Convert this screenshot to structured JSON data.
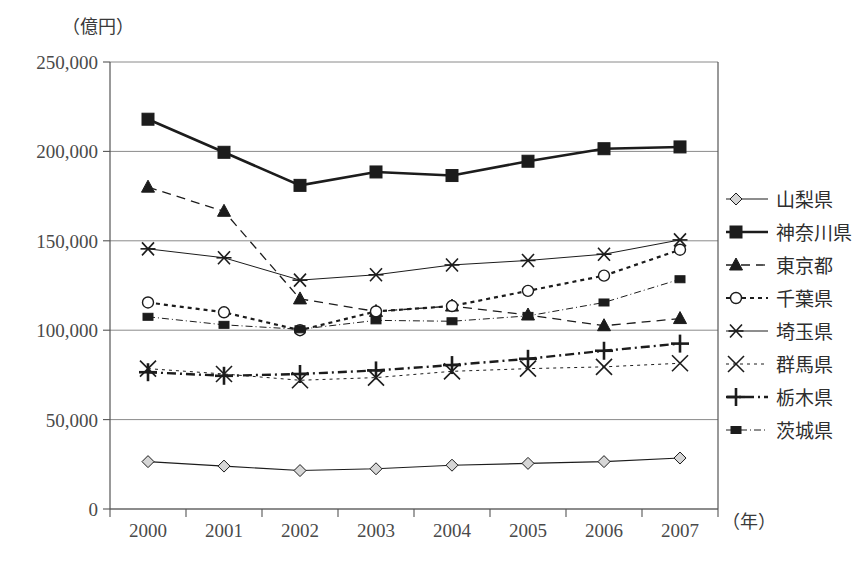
{
  "chart_data": {
    "type": "line",
    "title": "",
    "unit_label": "（億円）",
    "xlabel": "（年）",
    "ylabel": "",
    "categories": [
      "2000",
      "2001",
      "2002",
      "2003",
      "2004",
      "2005",
      "2006",
      "2007"
    ],
    "x": [
      2000,
      2001,
      2002,
      2003,
      2004,
      2005,
      2006,
      2007
    ],
    "ylim": [
      0,
      250000
    ],
    "yticks": [
      0,
      50000,
      100000,
      150000,
      200000,
      250000
    ],
    "ytick_labels": [
      "0",
      "50,000",
      "100,000",
      "150,000",
      "200,000",
      "250,000"
    ],
    "grid": true,
    "legend_position": "right",
    "series": [
      {
        "name": "山梨県",
        "marker": "diamond",
        "dash": "solid",
        "values": [
          26500,
          24000,
          21500,
          22500,
          24500,
          25500,
          26500,
          28500
        ]
      },
      {
        "name": "神奈川県",
        "marker": "square-filled",
        "dash": "solid-thick",
        "values": [
          218000,
          199500,
          181000,
          188500,
          186500,
          194500,
          201500,
          202500
        ]
      },
      {
        "name": "東京都",
        "marker": "triangle",
        "dash": "dashed",
        "values": [
          180000,
          166500,
          117500,
          110500,
          113500,
          108500,
          102500,
          106500
        ]
      },
      {
        "name": "千葉県",
        "marker": "circle-open",
        "dash": "dotted",
        "values": [
          115500,
          110000,
          100000,
          110500,
          113500,
          122000,
          130500,
          145000
        ]
      },
      {
        "name": "埼玉県",
        "marker": "asterisk",
        "dash": "solid-thin",
        "values": [
          145500,
          140500,
          128000,
          131000,
          136500,
          139000,
          142500,
          150500
        ]
      },
      {
        "name": "群馬県",
        "marker": "x-cross",
        "dash": "dotted-fine",
        "values": [
          78500,
          75500,
          72000,
          73500,
          77000,
          78500,
          79500,
          81500
        ]
      },
      {
        "name": "栃木県",
        "marker": "plus",
        "dash": "dash-dot-thick",
        "values": [
          76500,
          74500,
          75500,
          77500,
          80500,
          84000,
          88500,
          92500
        ]
      },
      {
        "name": "茨城県",
        "marker": "square-small",
        "dash": "dash-dot-fine",
        "values": [
          107500,
          103000,
          100500,
          105500,
          105000,
          108000,
          115500,
          128500
        ]
      }
    ]
  },
  "colors": {
    "ink": "#1c1c1c",
    "axis": "#555555",
    "grid": "#8a8a8a",
    "text": "#3a3a3a"
  }
}
